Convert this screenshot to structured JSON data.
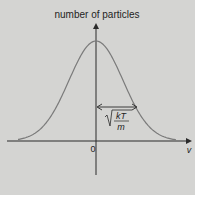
{
  "chart_data": {
    "type": "line",
    "title": "",
    "ylabel": "number of particles",
    "xlabel": "v",
    "x_tick_labels": [
      "0"
    ],
    "series": [
      {
        "name": "Maxwell velocity distribution",
        "shape": "gaussian",
        "center": 0,
        "x": [
          -3,
          -2.5,
          -2,
          -1.5,
          -1,
          -0.5,
          0,
          0.5,
          1,
          1.5,
          2,
          2.5,
          3
        ],
        "values": [
          0.011,
          0.044,
          0.135,
          0.325,
          0.607,
          0.882,
          1.0,
          0.882,
          0.607,
          0.325,
          0.135,
          0.044,
          0.011
        ]
      }
    ],
    "annotations": [
      {
        "type": "double-arrow",
        "from_x": 0,
        "to_x": 1,
        "label": "√(kT/m)",
        "label_numerator": "kT",
        "label_denominator": "m"
      }
    ],
    "grid": false,
    "legend": "none"
  },
  "labels": {
    "y_axis": "number of particles",
    "x_axis": "v",
    "origin": "0",
    "width_num": "kT",
    "width_den": "m"
  },
  "colors": {
    "background": "#d4d4d2",
    "curve": "#7a7a7a",
    "axis": "#2a2a2a"
  }
}
